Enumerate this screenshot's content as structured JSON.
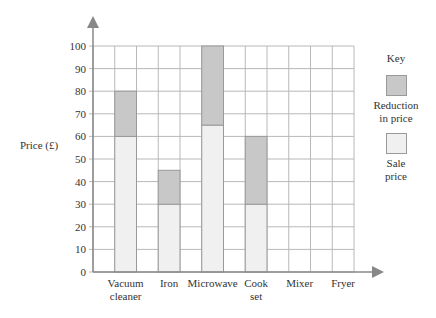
{
  "chart_data": {
    "type": "bar",
    "stacked": true,
    "title": "",
    "xlabel": "",
    "ylabel": "Price (£)",
    "ylim": [
      0,
      100
    ],
    "yticks": [
      0,
      10,
      20,
      30,
      40,
      50,
      60,
      70,
      80,
      90,
      100
    ],
    "grid": true,
    "legend_position": "right",
    "categories": [
      "Vacuum cleaner",
      "Iron",
      "Microwave",
      "Cook set",
      "Mixer",
      "Fryer"
    ],
    "series": [
      {
        "name": "Sale price",
        "color": "#f0f0f0",
        "values": [
          60,
          30,
          65,
          30,
          null,
          null
        ]
      },
      {
        "name": "Reduction in price",
        "color": "#c8c8c8",
        "values": [
          20,
          15,
          35,
          30,
          null,
          null
        ]
      }
    ],
    "original_prices": [
      80,
      45,
      100,
      60,
      null,
      null
    ]
  },
  "axis": {
    "ylabel": "Price (£)",
    "yticks": [
      "0",
      "10",
      "20",
      "30",
      "40",
      "50",
      "60",
      "70",
      "80",
      "90",
      "100"
    ],
    "categories": [
      {
        "line1": "Vacuum",
        "line2": "cleaner"
      },
      {
        "line1": "Iron",
        "line2": ""
      },
      {
        "line1": "Microwave",
        "line2": ""
      },
      {
        "line1": "Cook",
        "line2": "set"
      },
      {
        "line1": "Mixer",
        "line2": ""
      },
      {
        "line1": "Fryer",
        "line2": ""
      }
    ]
  },
  "key": {
    "title": "Key",
    "items": [
      {
        "line1": "Reduction",
        "line2": "in price",
        "color": "#c8c8c8"
      },
      {
        "line1": "Sale",
        "line2": "price",
        "color": "#f0f0f0"
      }
    ]
  }
}
